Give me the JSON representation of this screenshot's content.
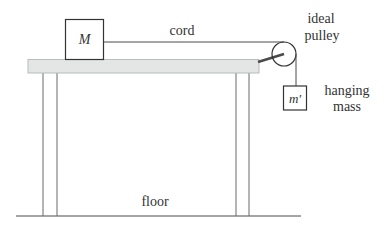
{
  "diagram": {
    "block_label": "M",
    "hanging_block_label": "m'",
    "cord_label": "cord",
    "pulley_label_line1": "ideal",
    "pulley_label_line2": "pulley",
    "hanging_label_line1": "hanging",
    "hanging_label_line2": "mass",
    "floor_label": "floor",
    "colors": {
      "line": "#4a4a4a",
      "table_fill": "#e4e6e6",
      "table_border": "#b8bcbc",
      "text": "#333333"
    }
  }
}
